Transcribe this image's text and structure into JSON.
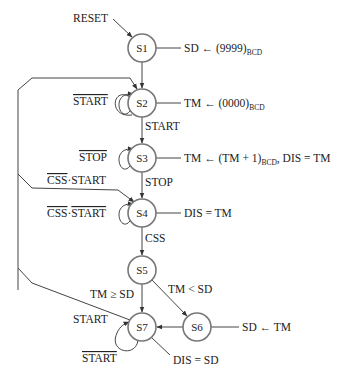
{
  "diagram": {
    "type": "state-machine",
    "entry_label": "RESET",
    "states": [
      {
        "id": "S1",
        "action": "SD ← (9999)",
        "action_sub": "BCD",
        "action_tail": ""
      },
      {
        "id": "S2",
        "action": "TM ← (0000)",
        "action_sub": "BCD",
        "action_tail": ""
      },
      {
        "id": "S3",
        "action": "TM ← (TM + 1)",
        "action_sub": "BCD",
        "action_tail": ", DIS = TM"
      },
      {
        "id": "S4",
        "action": "DIS = TM",
        "action_sub": "",
        "action_tail": ""
      },
      {
        "id": "S5",
        "action": "",
        "action_sub": "",
        "action_tail": ""
      },
      {
        "id": "S6",
        "action": "SD ← TM",
        "action_sub": "",
        "action_tail": ""
      },
      {
        "id": "S7",
        "action": "DIS = SD",
        "action_sub": "",
        "action_tail": ""
      }
    ],
    "transitions": {
      "s2_self": "START",
      "s2_to_s3": "START",
      "s3_self": "STOP",
      "s3_to_s4": "STOP",
      "s4_to_s2_a": "CSS",
      "s4_to_s2_b": "·START",
      "s4_self_a": "CSS",
      "s4_self_b": "·",
      "s4_self_c": "START",
      "s4_to_s5": "CSS",
      "s5_to_s7": "TM ≥ SD",
      "s5_to_s6": "TM < SD",
      "s7_to_s2": "START",
      "s7_self": "START"
    }
  }
}
